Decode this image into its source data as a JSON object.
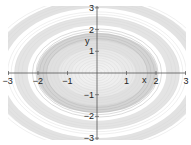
{
  "chart_data": {
    "type": "contour",
    "title": "",
    "xlabel": "x",
    "ylabel": "y",
    "xlim": [
      -3,
      3
    ],
    "ylim": [
      -3,
      3
    ],
    "x_ticks": [
      "-3",
      "-2",
      "-1",
      "1",
      "2",
      "3"
    ],
    "y_ticks": [
      "3",
      "2",
      "1",
      "-1",
      "-2",
      "-3"
    ],
    "grid": false,
    "legend": null,
    "contour_bands": [
      {
        "rx": 0.3,
        "ry": 0.25,
        "shade": "#f2f2f2"
      },
      {
        "rx": 0.6,
        "ry": 0.5,
        "shade": "#f0f0f0"
      },
      {
        "rx": 0.9,
        "ry": 0.75,
        "shade": "#eeeeee"
      },
      {
        "rx": 1.3,
        "ry": 1.1,
        "shade": "#e9e9e9"
      },
      {
        "rx": 1.7,
        "ry": 1.5,
        "shade": "#e0e0e0"
      },
      {
        "rx": 2.05,
        "ry": 1.85,
        "shade": "#d4d4d4"
      },
      {
        "rx": 2.35,
        "ry": 2.2,
        "shade": "#ffffff"
      },
      {
        "rx": 2.8,
        "ry": 2.6,
        "shade": "#e4e4e4"
      },
      {
        "rx": 3.2,
        "ry": 3.0,
        "shade": "#ffffff"
      },
      {
        "rx": 3.6,
        "ry": 3.4,
        "shade": "#e2e2e2"
      }
    ]
  },
  "axes": {
    "x_label": "x",
    "y_label": "y",
    "x_ticks": [
      {
        "value": -3,
        "label": "−3"
      },
      {
        "value": -2,
        "label": "−2"
      },
      {
        "value": -1,
        "label": "−1"
      },
      {
        "value": 1,
        "label": "1"
      },
      {
        "value": 2,
        "label": "2"
      },
      {
        "value": 3,
        "label": "3"
      }
    ],
    "y_ticks": [
      {
        "value": 3,
        "label": "3"
      },
      {
        "value": 2,
        "label": "2"
      },
      {
        "value": 1,
        "label": "1"
      },
      {
        "value": -1,
        "label": "−1"
      },
      {
        "value": -2,
        "label": "−2"
      },
      {
        "value": -3,
        "label": "−3"
      }
    ]
  },
  "colors": {
    "axis": "#555555",
    "text": "#222222",
    "background": "#ffffff"
  }
}
